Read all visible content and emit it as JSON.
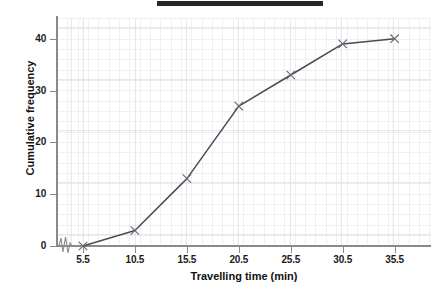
{
  "chart_data": {
    "type": "line",
    "title": "",
    "title_redacted": true,
    "xlabel": "Travelling time (min)",
    "ylabel": "Cumulative frequency",
    "x": [
      5.5,
      10.5,
      15.5,
      20.5,
      25.5,
      30.5,
      35.5
    ],
    "values": [
      0,
      3,
      13,
      27,
      33,
      39,
      40
    ],
    "series": [
      {
        "name": "Cumulative frequency",
        "x": [
          5.5,
          10.5,
          15.5,
          20.5,
          25.5,
          30.5,
          35.5
        ],
        "values": [
          0,
          3,
          13,
          27,
          33,
          39,
          40
        ]
      }
    ],
    "xtick_labels": [
      "5.5",
      "10.5",
      "15.5",
      "20.5",
      "25.5",
      "30.5",
      "35.5"
    ],
    "xtick_values": [
      5.5,
      10.5,
      15.5,
      20.5,
      25.5,
      30.5,
      35.5
    ],
    "ytick_labels": [
      "0",
      "10",
      "20",
      "30",
      "40"
    ],
    "ytick_values": [
      0,
      10,
      20,
      30,
      40
    ],
    "xlim": [
      3.0,
      39.0
    ],
    "ylim": [
      0,
      44
    ],
    "grid": true,
    "grid_minor": true,
    "legend": false,
    "legend_position": "none",
    "marker": "x",
    "line_color": "#4a4a52",
    "marker_color": "#6b6b73",
    "grid_color": "#dfe3e8",
    "grid_minor_color": "#eef0f3",
    "axis_color": "#8a8a8a",
    "axis_break": true,
    "axis_break_note": "zigzag break on x-axis near origin",
    "background": "#ffffff",
    "text_color": "#111111"
  },
  "annotations": {
    "redaction_bar": "title-redacted-black-bar"
  }
}
